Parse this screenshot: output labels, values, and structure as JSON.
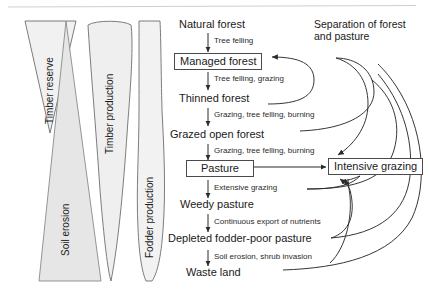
{
  "diagram": {
    "title_note": "Separation of forest and pasture",
    "background_color": "#ffffff",
    "line_color": "#3a3a3a",
    "shape_fill": "#ececec",
    "shape_stroke": "#6a6a6a"
  },
  "gradient_shapes": [
    {
      "name": "timber-reserve",
      "label": "Timber reserve",
      "form": "wide-top-narrow-bottom-triangle"
    },
    {
      "name": "soil-erosion",
      "label": "Soil erosion",
      "form": "narrow-top-wide-bottom-triangle"
    },
    {
      "name": "timber-production",
      "label": "Timber production",
      "form": "wide-top-tapering-bottom"
    },
    {
      "name": "fodder-production",
      "label": "Fodder production",
      "form": "narrow-top-bulge-middle-taper-bottom"
    }
  ],
  "flow": {
    "nodes": [
      {
        "id": "natural-forest",
        "label": "Natural forest",
        "boxed": false
      },
      {
        "id": "managed-forest",
        "label": "Managed forest",
        "boxed": true
      },
      {
        "id": "thinned-forest",
        "label": "Thinned forest",
        "boxed": false
      },
      {
        "id": "grazed-open-forest",
        "label": "Grazed open forest",
        "boxed": false
      },
      {
        "id": "pasture",
        "label": "Pasture",
        "boxed": true
      },
      {
        "id": "weedy-pasture",
        "label": "Weedy pasture",
        "boxed": false
      },
      {
        "id": "depleted-fodder-poor-pasture",
        "label": "Depleted fodder-poor pasture",
        "boxed": false
      },
      {
        "id": "waste-land",
        "label": "Waste land",
        "boxed": false
      },
      {
        "id": "intensive-grazing",
        "label": "Intensive grazing",
        "boxed": true
      }
    ],
    "edge_labels": [
      {
        "id": "e1",
        "from": "natural-forest",
        "to": "managed-forest",
        "label": "Tree felling"
      },
      {
        "id": "e2",
        "from": "managed-forest",
        "to": "thinned-forest",
        "label": "Tree felling, grazing"
      },
      {
        "id": "e3",
        "from": "thinned-forest",
        "to": "grazed-open-forest",
        "label": "Grazing, tree felling, burning"
      },
      {
        "id": "e4",
        "from": "grazed-open-forest",
        "to": "pasture",
        "label": "Grazing, tree felling, burning"
      },
      {
        "id": "e5",
        "from": "pasture",
        "to": "weedy-pasture",
        "label": "Extensive grazing"
      },
      {
        "id": "e6",
        "from": "weedy-pasture",
        "to": "depleted-fodder-poor-pasture",
        "label": "Continuous export of nutrients"
      },
      {
        "id": "e7",
        "from": "depleted-fodder-poor-pasture",
        "to": "waste-land",
        "label": "Soil erosion, shrub invasion"
      }
    ],
    "feedback_edges": [
      {
        "id": "f1",
        "from": "thinned-forest",
        "to": "managed-forest",
        "style": "curved-return-left-arrow"
      },
      {
        "id": "f2",
        "from": "pasture",
        "to": "intensive-grazing",
        "style": "straight-right-arrow"
      },
      {
        "id": "f3",
        "from": "grazed-open-forest",
        "to": "intensive-grazing",
        "style": "curved-right-then-up"
      },
      {
        "id": "f4",
        "from": "weedy-pasture",
        "to": "intensive-grazing",
        "style": "curved-right-then-up"
      },
      {
        "id": "f5",
        "from": "depleted-fodder-poor-pasture",
        "to": "intensive-grazing",
        "style": "curved-right-then-up"
      },
      {
        "id": "f6",
        "from": "waste-land",
        "to": "intensive-grazing",
        "style": "curved-right-then-up"
      }
    ]
  }
}
